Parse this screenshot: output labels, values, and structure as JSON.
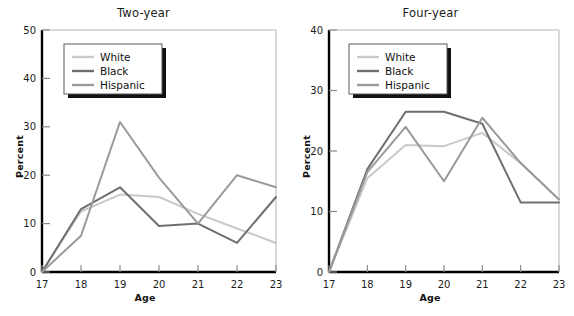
{
  "figure": {
    "background": "#ffffff",
    "axis_color": "#000000",
    "tick_color": "#808080"
  },
  "legend": {
    "entries": [
      {
        "label": "White",
        "color": "#c9c9c9"
      },
      {
        "label": "Black",
        "color": "#6f6f6f"
      },
      {
        "label": "Hispanic",
        "color": "#9a9a9a"
      }
    ],
    "border_color": "#5a5a5a",
    "shadow_color": "#111111",
    "background": "#ffffff"
  },
  "panels": [
    {
      "title": "Two-year",
      "xlabel": "Age",
      "ylabel": "Percent",
      "xticks": [
        "17",
        "18",
        "19",
        "20",
        "21",
        "22",
        "23"
      ],
      "yticks": [
        "0",
        "10",
        "20",
        "30",
        "40",
        "50"
      ]
    },
    {
      "title": "Four-year",
      "xlabel": "Age",
      "ylabel": "Percent",
      "xticks": [
        "17",
        "18",
        "19",
        "20",
        "21",
        "22",
        "23"
      ],
      "yticks": [
        "0",
        "10",
        "20",
        "30",
        "40"
      ]
    }
  ],
  "chart_data": [
    {
      "type": "line",
      "title": "Two-year",
      "xlabel": "Age",
      "ylabel": "Percent",
      "x": [
        17,
        18,
        19,
        20,
        21,
        22,
        23
      ],
      "categories": [
        "17",
        "18",
        "19",
        "20",
        "21",
        "22",
        "23"
      ],
      "xlim": [
        17,
        23
      ],
      "ylim": [
        0,
        50
      ],
      "yticks": [
        0,
        10,
        20,
        30,
        40,
        50
      ],
      "grid": false,
      "legend_position": "upper-left",
      "series": [
        {
          "name": "White",
          "color": "#c9c9c9",
          "values": [
            0,
            12.5,
            16.0,
            15.5,
            12.0,
            9.0,
            6.0
          ]
        },
        {
          "name": "Black",
          "color": "#6f6f6f",
          "values": [
            0,
            13.0,
            17.5,
            9.5,
            10.0,
            6.0,
            15.5
          ]
        },
        {
          "name": "Hispanic",
          "color": "#9a9a9a",
          "values": [
            0,
            7.5,
            31.0,
            19.5,
            10.0,
            20.0,
            17.5
          ]
        }
      ]
    },
    {
      "type": "line",
      "title": "Four-year",
      "xlabel": "Age",
      "ylabel": "Percent",
      "x": [
        17,
        18,
        19,
        20,
        21,
        22,
        23
      ],
      "categories": [
        "17",
        "18",
        "19",
        "20",
        "21",
        "22",
        "23"
      ],
      "xlim": [
        17,
        23
      ],
      "ylim": [
        0,
        40
      ],
      "yticks": [
        0,
        10,
        20,
        30,
        40
      ],
      "grid": false,
      "legend_position": "upper-left",
      "series": [
        {
          "name": "White",
          "color": "#c9c9c9",
          "values": [
            0,
            15.5,
            21.0,
            20.8,
            23.0,
            18.0,
            12.0
          ]
        },
        {
          "name": "Black",
          "color": "#6f6f6f",
          "values": [
            0,
            17.0,
            26.5,
            26.5,
            24.5,
            11.5,
            11.5
          ]
        },
        {
          "name": "Hispanic",
          "color": "#9a9a9a",
          "values": [
            0,
            16.5,
            24.0,
            15.0,
            25.5,
            18.0,
            12.0
          ]
        }
      ]
    }
  ]
}
